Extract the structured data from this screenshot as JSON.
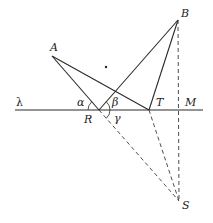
{
  "diagram": {
    "type": "geometry-reflection",
    "points": {
      "A": {
        "label": "A",
        "x": 52,
        "y": 56
      },
      "B": {
        "label": "B",
        "x": 178,
        "y": 20
      },
      "R": {
        "label": "R",
        "x": 99,
        "y": 110
      },
      "T": {
        "label": "T",
        "x": 149,
        "y": 110
      },
      "M": {
        "label": "M",
        "x": 180,
        "y": 110
      },
      "S": {
        "label": "S",
        "x": 179,
        "y": 201
      }
    },
    "line_label": "λ",
    "angles": {
      "alpha": "α",
      "beta": "β",
      "gamma": "γ"
    },
    "colors": {
      "stroke": "#2a2a2a",
      "background": "#ffffff"
    }
  }
}
